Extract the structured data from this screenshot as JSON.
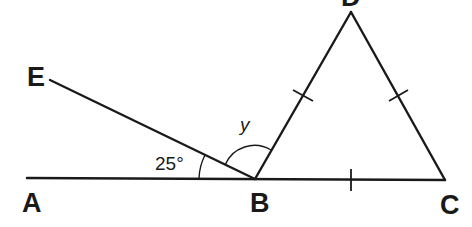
{
  "diagram": {
    "type": "geometry",
    "points": {
      "A": {
        "label": "A",
        "x": 27,
        "y": 178
      },
      "B": {
        "label": "B",
        "x": 255,
        "y": 179
      },
      "C": {
        "label": "C",
        "x": 445,
        "y": 180
      },
      "D": {
        "label": "D",
        "x": 351,
        "y": 12
      },
      "E": {
        "label": "E",
        "x": 48,
        "y": 79
      }
    },
    "segments": [
      "AC",
      "EB",
      "BD",
      "DC"
    ],
    "angles": {
      "EBA": {
        "label": "25°"
      },
      "EBD": {
        "label": "y"
      }
    },
    "equal_marks": [
      "BD",
      "DC",
      "BC"
    ],
    "colors": {
      "stroke": "#1a1a1a",
      "background": "#ffffff"
    }
  }
}
